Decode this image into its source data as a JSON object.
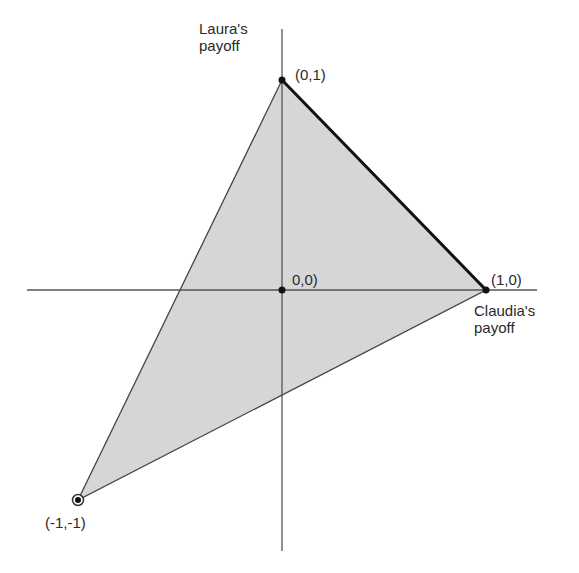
{
  "diagram": {
    "type": "payoff-region",
    "axes": {
      "x_label_line1": "Claudia's",
      "x_label_line2": "payoff",
      "y_label_line1": "Laura's",
      "y_label_line2": "payoff"
    },
    "points": [
      {
        "id": "p01",
        "label": "(0,1)",
        "x": 0,
        "y": 1
      },
      {
        "id": "p10",
        "label": "(1,0)",
        "x": 1,
        "y": 0
      },
      {
        "id": "p00",
        "label": "0,0)",
        "x": 0,
        "y": 0
      },
      {
        "id": "pm1m1",
        "label": "(-1,-1)",
        "x": -1,
        "y": -1
      }
    ],
    "region": {
      "vertices": [
        "(0,1)",
        "(1,0)",
        "(-1,-1)"
      ],
      "fill": "#d6d6d6"
    },
    "highlighted_edge": {
      "from": "(0,1)",
      "to": "(1,0)"
    },
    "colors": {
      "axis": "#555555",
      "edge": "#444444",
      "frontier": "#111111",
      "point": "#111111"
    }
  }
}
